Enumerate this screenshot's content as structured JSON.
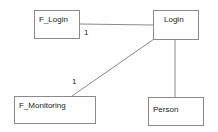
{
  "diagram": {
    "type": "class-association-diagram",
    "nodes": [
      {
        "id": "f_login",
        "label": "F_Login"
      },
      {
        "id": "login",
        "label": "Login"
      },
      {
        "id": "f_monitoring",
        "label": "F_Monitoring"
      },
      {
        "id": "person",
        "label": "Person"
      }
    ],
    "edges": [
      {
        "from": "f_login",
        "to": "login",
        "multiplicity": "1"
      },
      {
        "from": "login",
        "to": "f_monitoring",
        "multiplicity": "1"
      },
      {
        "from": "login",
        "to": "person",
        "multiplicity": ""
      }
    ],
    "colors": {
      "line": "#8a8a8a",
      "text": "#222222",
      "background": "#ffffff"
    }
  }
}
